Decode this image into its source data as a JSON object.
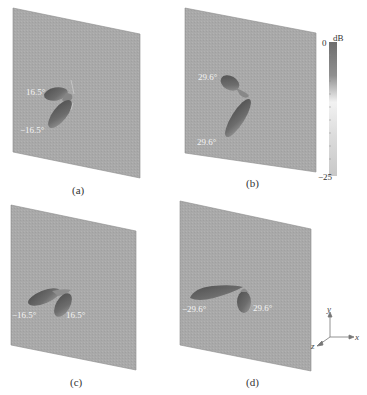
{
  "figure": {
    "panels": [
      {
        "id": "a",
        "caption": "(a)",
        "beam_labels": [
          "16.5°",
          "−16.5°"
        ]
      },
      {
        "id": "b",
        "caption": "(b)",
        "beam_labels": [
          "29.6°",
          "29.6°"
        ]
      },
      {
        "id": "c",
        "caption": "(c)",
        "beam_labels": [
          "−16.5°",
          "16.5°"
        ]
      },
      {
        "id": "d",
        "caption": "(d)",
        "beam_labels": [
          "−29.6°",
          "29.6°"
        ]
      }
    ],
    "colorbar": {
      "unit": "dB",
      "max_label": "0",
      "min_label": "−25",
      "top_color": "#6e6e6e",
      "mid_color": "#f2f2f2",
      "bottom_color": "#c8c8c8"
    },
    "axes": {
      "x": "x",
      "y": "y",
      "z": "z"
    },
    "colors": {
      "surface": "#a9a9a9",
      "surface_edge": "#8c8c8c",
      "lobe_dark": "#555555",
      "lobe_light": "#8a8a8a"
    }
  }
}
